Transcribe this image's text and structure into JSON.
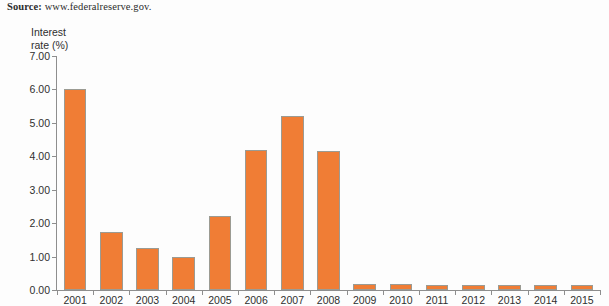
{
  "source": {
    "label": "Source:",
    "url": "www.federalreserve.gov."
  },
  "chart_data": {
    "type": "bar",
    "title": "",
    "xlabel": "",
    "ylabel": "Interest\nrate (%)",
    "ylabel_line1": "Interest",
    "ylabel_line2": "rate (%)",
    "categories": [
      "2001",
      "2002",
      "2003",
      "2004",
      "2005",
      "2006",
      "2007",
      "2008",
      "2009",
      "2010",
      "2011",
      "2012",
      "2013",
      "2014",
      "2015"
    ],
    "values": [
      6.0,
      1.75,
      1.25,
      1.0,
      2.2,
      4.2,
      5.2,
      4.15,
      0.18,
      0.17,
      0.16,
      0.16,
      0.15,
      0.15,
      0.15
    ],
    "ylim": [
      0.0,
      7.0
    ],
    "ytick_values": [
      0.0,
      1.0,
      2.0,
      3.0,
      4.0,
      5.0,
      6.0,
      7.0
    ],
    "ytick_labels": [
      "0.00",
      "1.00",
      "2.00",
      "3.00",
      "4.00",
      "5.00",
      "6.00",
      "7.00"
    ],
    "grid": false,
    "legend": false,
    "bar_color": "#f07d35",
    "bar_border_color": "#9b9b93",
    "axis_color": "#8e8e8e",
    "background": "#fdfdfd"
  }
}
